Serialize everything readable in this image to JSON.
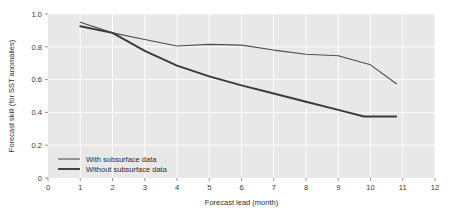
{
  "chart_data": {
    "type": "line",
    "title": "",
    "xlabel": "Forecast lead (month)",
    "ylabel": "Forecast skill (for SST anomalies)",
    "xlim": [
      0,
      12
    ],
    "ylim": [
      0,
      1.0
    ],
    "xticks": [
      "0",
      "1",
      "2",
      "3",
      "4",
      "5",
      "6",
      "7",
      "8",
      "9",
      "10",
      "11",
      "12"
    ],
    "yticks": [
      "0",
      "0.2",
      "0.4",
      "0.6",
      "0.8",
      "1.0"
    ],
    "grid": true,
    "legend_position": "lower left inside axes",
    "plot_background": "#e8e8e8",
    "grid_color": "#ffffff",
    "series": [
      {
        "name": "With subsurface data",
        "color": "#4d4d4d",
        "line_width": 1.1,
        "x": [
          1,
          2,
          3,
          4,
          5,
          6,
          7,
          8,
          9,
          10,
          10.8
        ],
        "values": [
          0.95,
          0.885,
          0.845,
          0.805,
          0.815,
          0.81,
          0.78,
          0.755,
          0.745,
          0.69,
          0.575
        ]
      },
      {
        "name": "Without subsurface data",
        "color": "#3a3a3a",
        "line_width": 1.9,
        "x": [
          1,
          2,
          3,
          4,
          5,
          6,
          7,
          8,
          9,
          9.8,
          10.8
        ],
        "values": [
          0.925,
          0.885,
          0.775,
          0.685,
          0.62,
          0.565,
          0.515,
          0.465,
          0.415,
          0.375,
          0.375
        ]
      }
    ]
  },
  "legend": {
    "entries": [
      {
        "label": "With subsurface data"
      },
      {
        "label": "Without subsurface data"
      }
    ]
  }
}
